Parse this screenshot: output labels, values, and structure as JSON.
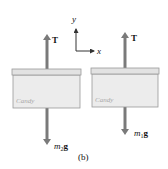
{
  "figure": {
    "panel_label": "(b)",
    "axes": {
      "x_label": "x",
      "y_label": "y"
    },
    "objects": [
      {
        "id": "left-box",
        "brand_text": "Candy",
        "force_up": {
          "label": "T"
        },
        "force_down": {
          "mass_symbol": "m",
          "subscript": "2",
          "g_symbol": "g"
        }
      },
      {
        "id": "right-box",
        "brand_text": "Candy",
        "force_up": {
          "label": "T"
        },
        "force_down": {
          "mass_symbol": "m",
          "subscript": "1",
          "g_symbol": "g"
        }
      }
    ],
    "colors": {
      "arrow": "#7a7a7a",
      "box_fill": "#ececec",
      "box_lid": "#e2e2e2",
      "box_stroke": "#9a9a9a",
      "text": "#111111"
    }
  }
}
